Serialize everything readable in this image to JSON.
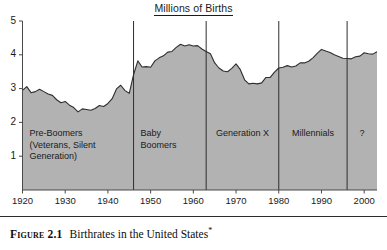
{
  "figure": {
    "number_label": "Figure 2.1",
    "caption_text": "Birthrates in the United States",
    "footnote_marker": "*"
  },
  "chart_data": {
    "type": "area",
    "title": "Millions of Births",
    "xlabel": "",
    "ylabel": "Millions of Births",
    "xlim": [
      1920,
      2003
    ],
    "ylim": [
      0,
      5
    ],
    "grid": false,
    "legend": "none",
    "yticks": [
      1,
      2,
      3,
      4,
      5
    ],
    "ytick_labels": [
      "1",
      "2",
      "3",
      "4",
      "5"
    ],
    "xticks": [
      1920,
      1930,
      1940,
      1950,
      1960,
      1970,
      1980,
      1990,
      2000
    ],
    "xtick_labels": [
      "1920",
      "1930",
      "1940",
      "1950",
      "1960",
      "1970",
      "1980",
      "1990",
      "2000"
    ],
    "fill_color": "#b2b2b2",
    "line_color": "#2e2e2e",
    "series": [
      {
        "name": "Births",
        "x": [
          1920,
          1921,
          1922,
          1923,
          1924,
          1925,
          1926,
          1927,
          1928,
          1929,
          1930,
          1931,
          1932,
          1933,
          1934,
          1935,
          1936,
          1937,
          1938,
          1939,
          1940,
          1941,
          1942,
          1943,
          1944,
          1945,
          1946,
          1947,
          1948,
          1949,
          1950,
          1951,
          1952,
          1953,
          1954,
          1955,
          1956,
          1957,
          1958,
          1959,
          1960,
          1961,
          1962,
          1963,
          1964,
          1965,
          1966,
          1967,
          1968,
          1969,
          1970,
          1971,
          1972,
          1973,
          1974,
          1975,
          1976,
          1977,
          1978,
          1979,
          1980,
          1981,
          1982,
          1983,
          1984,
          1985,
          1986,
          1987,
          1988,
          1989,
          1990,
          1991,
          1992,
          1993,
          1994,
          1995,
          1996,
          1997,
          1998,
          1999,
          2000,
          2001,
          2002,
          2003
        ],
        "values": [
          2.95,
          3.06,
          2.88,
          2.91,
          2.98,
          2.91,
          2.84,
          2.8,
          2.67,
          2.58,
          2.62,
          2.51,
          2.44,
          2.31,
          2.4,
          2.38,
          2.36,
          2.41,
          2.5,
          2.47,
          2.56,
          2.7,
          2.99,
          3.1,
          2.94,
          2.86,
          3.41,
          3.82,
          3.64,
          3.65,
          3.63,
          3.82,
          3.91,
          3.97,
          4.08,
          4.1,
          4.22,
          4.31,
          4.26,
          4.3,
          4.26,
          4.27,
          4.17,
          4.1,
          4.03,
          3.76,
          3.61,
          3.52,
          3.5,
          3.6,
          3.73,
          3.56,
          3.26,
          3.14,
          3.16,
          3.14,
          3.17,
          3.33,
          3.33,
          3.49,
          3.61,
          3.63,
          3.68,
          3.64,
          3.67,
          3.76,
          3.76,
          3.81,
          3.91,
          4.04,
          4.16,
          4.11,
          4.07,
          4.0,
          3.95,
          3.9,
          3.89,
          3.88,
          3.94,
          3.96,
          4.06,
          4.03,
          4.02,
          4.09
        ]
      }
    ],
    "annotations": [
      {
        "id": "pre-boomers",
        "label": "Pre-Boomers\n(Veterans, Silent\nGeneration)",
        "x_start": 1920,
        "x_end": 1946,
        "align": "left"
      },
      {
        "id": "baby-boomers",
        "label": "Baby\nBoomers",
        "x_start": 1946,
        "x_end": 1963,
        "align": "left"
      },
      {
        "id": "generation-x",
        "label": "Generation X",
        "x_start": 1963,
        "x_end": 1980,
        "align": "center"
      },
      {
        "id": "millennials",
        "label": "Millennials",
        "x_start": 1980,
        "x_end": 1996,
        "align": "center"
      },
      {
        "id": "unknown-generation",
        "label": "?",
        "x_start": 1996,
        "x_end": 2003,
        "align": "center"
      }
    ],
    "dividers": [
      1946,
      1963,
      1980,
      1996
    ]
  }
}
